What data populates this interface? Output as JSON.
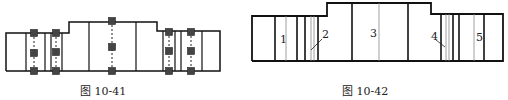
{
  "figures": [
    {
      "id": "fig-10-41",
      "caption": "图 10-41",
      "description": "Stepped shaft outline with dimension-chain nodes (dark squares connected by dashed lines)",
      "outline": [
        [
          6,
          71
        ],
        [
          6,
          33
        ],
        [
          69,
          33
        ],
        [
          69,
          22
        ],
        [
          157,
          22
        ],
        [
          157,
          31
        ],
        [
          220,
          31
        ],
        [
          220,
          71
        ],
        [
          6,
          71
        ]
      ],
      "vertical_lines": [
        26,
        45,
        51,
        62,
        89,
        136,
        163,
        175,
        181,
        202
      ],
      "node_columns": [
        {
          "x": 34,
          "ys": [
            33,
            53,
            71
          ]
        },
        {
          "x": 56,
          "ys": [
            33,
            52,
            71
          ]
        },
        {
          "x": 112,
          "ys": [
            21,
            47,
            71
          ]
        },
        {
          "x": 169,
          "ys": [
            32,
            51,
            71
          ]
        },
        {
          "x": 191,
          "ys": [
            32,
            51,
            71
          ]
        }
      ]
    },
    {
      "id": "fig-10-42",
      "caption": "图 10-42",
      "description": "Stepped shaft outline with numbered segments",
      "outline": [
        [
          252,
          61
        ],
        [
          252,
          16
        ],
        [
          327,
          16
        ],
        [
          327,
          3
        ],
        [
          431,
          3
        ],
        [
          431,
          14
        ],
        [
          503,
          14
        ],
        [
          503,
          61
        ],
        [
          252,
          61
        ]
      ],
      "thick_lines": [
        275,
        297,
        305,
        318,
        352,
        408,
        441,
        453,
        459,
        484
      ],
      "thin_lines": [
        286,
        311,
        314,
        379,
        446,
        449,
        474
      ],
      "labels": [
        {
          "text": "1",
          "x": 280,
          "y": 43
        },
        {
          "text": "2",
          "x": 322,
          "y": 38
        },
        {
          "text": "3",
          "x": 370,
          "y": 37
        },
        {
          "text": "4",
          "x": 431,
          "y": 40
        },
        {
          "text": "5",
          "x": 476,
          "y": 41
        }
      ],
      "leaders": [
        {
          "x1": 322,
          "y1": 39,
          "x2": 311,
          "y2": 50
        },
        {
          "x1": 436,
          "y1": 40,
          "x2": 445,
          "y2": 47
        }
      ]
    }
  ]
}
